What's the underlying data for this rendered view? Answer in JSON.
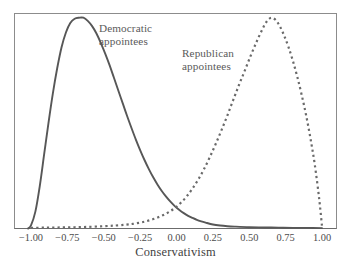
{
  "chart_data": {
    "type": "line",
    "title": "",
    "subtitle": "",
    "xlabel": "Conservativism",
    "ylabel": "",
    "xlim": [
      -1.05,
      1.05
    ],
    "ylim": [
      0,
      1.02
    ],
    "xticks": [
      "-1.00",
      "-0.75",
      "-0.50",
      "-0.25",
      "0.00",
      "0.25",
      "0.50",
      "0.75",
      "1.00"
    ],
    "xtick_values": [
      -1,
      -0.75,
      -0.5,
      -0.25,
      0,
      0.25,
      0.5,
      0.75,
      1
    ],
    "yticks": [],
    "grid": false,
    "legend_position": "inline-annotations",
    "frame": "box",
    "annotations": [
      {
        "text_line1": "Democratic",
        "text_line2": "appointees",
        "x": -0.42,
        "y": 0.93
      },
      {
        "text_line1": "Republican",
        "text_line2": "appointees",
        "x": 0.12,
        "y": 0.78
      }
    ],
    "series": [
      {
        "name": "Democratic appointees",
        "style": "solid",
        "color": "#575757",
        "peak_x": -0.64,
        "peak_y": 1.0,
        "x": [
          -1.02,
          -1.0,
          -0.97,
          -0.94,
          -0.91,
          -0.88,
          -0.85,
          -0.82,
          -0.79,
          -0.76,
          -0.73,
          -0.7,
          -0.67,
          -0.64,
          -0.61,
          -0.58,
          -0.55,
          -0.52,
          -0.49,
          -0.46,
          -0.43,
          -0.4,
          -0.37,
          -0.34,
          -0.31,
          -0.28,
          -0.25,
          -0.22,
          -0.19,
          -0.16,
          -0.13,
          -0.1,
          -0.07,
          -0.04,
          -0.01,
          0.02,
          0.05,
          0.08,
          0.11,
          0.14,
          0.17,
          0.2,
          0.25,
          0.3,
          0.35,
          0.4,
          0.5,
          0.6,
          0.7,
          0.8,
          0.9,
          1.0
        ],
        "y": [
          0.0,
          0.015,
          0.08,
          0.2,
          0.35,
          0.5,
          0.64,
          0.76,
          0.86,
          0.93,
          0.975,
          0.995,
          1.0,
          1.0,
          0.985,
          0.96,
          0.925,
          0.88,
          0.83,
          0.775,
          0.715,
          0.655,
          0.595,
          0.535,
          0.478,
          0.423,
          0.372,
          0.325,
          0.282,
          0.243,
          0.208,
          0.177,
          0.15,
          0.126,
          0.105,
          0.088,
          0.073,
          0.06,
          0.05,
          0.041,
          0.034,
          0.028,
          0.019,
          0.014,
          0.011,
          0.009,
          0.006,
          0.005,
          0.004,
          0.003,
          0.003,
          0.002
        ]
      },
      {
        "name": "Republican appointees",
        "style": "dashed",
        "color": "#6a6a6a",
        "peak_x": 0.65,
        "peak_y": 1.0,
        "x": [
          -1.0,
          -0.9,
          -0.8,
          -0.7,
          -0.6,
          -0.5,
          -0.42,
          -0.35,
          -0.3,
          -0.25,
          -0.21,
          -0.17,
          -0.13,
          -0.09,
          -0.05,
          -0.01,
          0.03,
          0.07,
          0.11,
          0.15,
          0.19,
          0.23,
          0.27,
          0.31,
          0.35,
          0.39,
          0.43,
          0.47,
          0.51,
          0.55,
          0.59,
          0.62,
          0.65,
          0.68,
          0.71,
          0.74,
          0.77,
          0.8,
          0.83,
          0.86,
          0.89,
          0.92,
          0.95,
          0.98,
          1.0
        ],
        "y": [
          0.003,
          0.004,
          0.005,
          0.006,
          0.008,
          0.011,
          0.014,
          0.018,
          0.022,
          0.028,
          0.034,
          0.042,
          0.052,
          0.064,
          0.079,
          0.098,
          0.122,
          0.152,
          0.19,
          0.233,
          0.283,
          0.34,
          0.402,
          0.468,
          0.537,
          0.61,
          0.682,
          0.75,
          0.82,
          0.885,
          0.945,
          0.982,
          1.0,
          0.99,
          0.96,
          0.915,
          0.86,
          0.795,
          0.72,
          0.635,
          0.54,
          0.43,
          0.305,
          0.145,
          0.01
        ]
      }
    ]
  },
  "axis": {
    "title": "Conservativism"
  },
  "labels": {
    "democratic_line1": "Democratic",
    "democratic_line2": "appointees",
    "republican_line1": "Republican",
    "republican_line2": "appointees"
  },
  "colors": {
    "democratic": "#575757",
    "republican": "#6a6a6a",
    "frame": "#8c8c8c",
    "axis_line": "#6b6b6b",
    "text": "#4c4c4c",
    "background": "#ffffff"
  }
}
